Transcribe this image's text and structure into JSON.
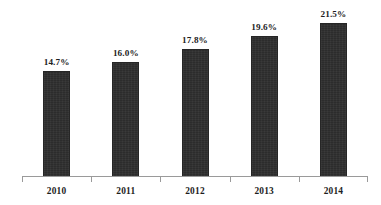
{
  "chart_data": {
    "type": "bar",
    "title": "",
    "subtitle": "",
    "xlabel": "",
    "ylabel": "",
    "categories": [
      "2010",
      "2011",
      "2012",
      "2013",
      "2014"
    ],
    "values": [
      14.7,
      16.0,
      17.8,
      19.6,
      21.5
    ],
    "value_labels": [
      "14.7%",
      "16.0%",
      "17.8%",
      "19.6%",
      "21.5%"
    ],
    "unit": "%",
    "ylim": [
      0,
      24.5
    ],
    "grid": false,
    "legend": null,
    "legend_position": "none",
    "axis": {
      "x_axis_visible": true,
      "y_axis_visible": false,
      "x_tick_style": "boundary-ticks-below",
      "x_tick_count": 6
    },
    "series": [
      {
        "name": "",
        "values": [
          14.7,
          16.0,
          17.8,
          19.6,
          21.5
        ]
      }
    ]
  },
  "style": {
    "bar_color": "#2c2c2c",
    "axis_color": "#9a9a9a",
    "text_color": "#1d1d1d",
    "background_color": "#ffffff"
  }
}
